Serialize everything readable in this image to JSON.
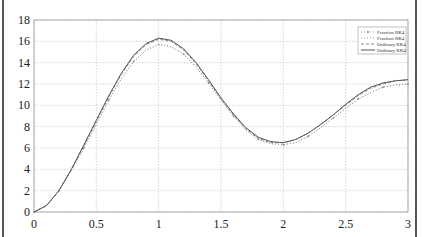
{
  "chart_data": {
    "type": "line",
    "title": "",
    "xlabel": "",
    "ylabel": "",
    "xlim": [
      0,
      3
    ],
    "ylim": [
      0,
      18
    ],
    "grid": true,
    "legend_position": "upper right",
    "x_ticks": [
      "0",
      "0.5",
      "1",
      "1.5",
      "2",
      "2.5",
      "3"
    ],
    "y_ticks": [
      "0",
      "2",
      "4",
      "6",
      "8",
      "10",
      "12",
      "14",
      "16",
      "18"
    ],
    "x": [
      0,
      0.1,
      0.2,
      0.3,
      0.4,
      0.5,
      0.6,
      0.7,
      0.8,
      0.9,
      1.0,
      1.1,
      1.2,
      1.3,
      1.4,
      1.5,
      1.6,
      1.7,
      1.8,
      1.9,
      2.0,
      2.1,
      2.2,
      2.3,
      2.4,
      2.5,
      2.6,
      2.7,
      2.8,
      2.9,
      3.0
    ],
    "series": [
      {
        "name": "Fraction RK4",
        "style": "dotted-markers",
        "color": "#888888",
        "values": [
          0,
          0.6,
          2.0,
          3.9,
          6.0,
          8.2,
          10.5,
          12.5,
          14.1,
          15.2,
          15.7,
          15.5,
          14.8,
          13.6,
          12.1,
          10.5,
          9.0,
          7.7,
          6.8,
          6.4,
          6.3,
          6.5,
          7.1,
          7.9,
          8.8,
          9.7,
          10.6,
          11.2,
          11.7,
          11.9,
          12.0
        ]
      },
      {
        "name": "Fraction RK4",
        "style": "dotted",
        "color": "#999999",
        "values": [
          0,
          0.6,
          2.0,
          3.9,
          6.0,
          8.2,
          10.5,
          12.5,
          14.1,
          15.2,
          15.7,
          15.5,
          14.8,
          13.6,
          12.1,
          10.5,
          9.0,
          7.7,
          6.8,
          6.4,
          6.3,
          6.5,
          7.1,
          7.9,
          8.8,
          9.7,
          10.6,
          11.2,
          11.7,
          11.9,
          12.0
        ]
      },
      {
        "name": "Ordinary RK4",
        "style": "dashed",
        "color": "#777777",
        "values": [
          0,
          0.6,
          2.0,
          4.0,
          6.2,
          8.5,
          10.8,
          12.9,
          14.6,
          15.7,
          16.2,
          16.0,
          15.2,
          13.9,
          12.3,
          10.6,
          9.1,
          7.8,
          6.9,
          6.5,
          6.5,
          6.8,
          7.4,
          8.2,
          9.1,
          10.0,
          10.9,
          11.6,
          12.0,
          12.3,
          12.4
        ]
      },
      {
        "name": "Ordinary RK4",
        "style": "solid",
        "color": "#555555",
        "values": [
          0,
          0.6,
          2.0,
          4.0,
          6.3,
          8.6,
          10.9,
          13.0,
          14.7,
          15.8,
          16.3,
          16.1,
          15.3,
          14.0,
          12.4,
          10.7,
          9.2,
          7.9,
          7.0,
          6.6,
          6.5,
          6.8,
          7.4,
          8.2,
          9.1,
          10.1,
          11.0,
          11.7,
          12.1,
          12.3,
          12.4
        ]
      }
    ]
  },
  "legend": {
    "items": [
      {
        "label": "Fraction RK4"
      },
      {
        "label": "Fraction RK4"
      },
      {
        "label": "Ordinary RK4"
      },
      {
        "label": "Ordinary RK4"
      }
    ]
  }
}
